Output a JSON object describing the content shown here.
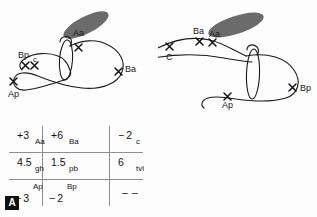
{
  "figure": {
    "panels": [
      {
        "id": "A",
        "badge": "A",
        "diagram": {
          "markers": [
            {
              "label": "Aa",
              "x": 78,
              "y": 38
            },
            {
              "label": "Ba",
              "x": 119,
              "y": 70
            },
            {
              "label": "Bp",
              "x": 22,
              "y": 58
            },
            {
              "label": "c",
              "x": 35,
              "y": 59
            },
            {
              "label": "Ap",
              "x": 12,
              "y": 88
            }
          ],
          "shapes": {
            "ellipse_fill": "#6b6b6b",
            "curve_stroke": "#1a1a1a"
          }
        },
        "table": {
          "rows": [
            [
              {
                "num": "+3",
                "tag": "Aa",
                "layout": "numtag"
              },
              {
                "num": "+6",
                "tag": "Ba",
                "layout": "numtag"
              },
              {
                "num": "− 2",
                "tag": "c",
                "layout": "numtag"
              }
            ],
            [
              {
                "num": "4.5",
                "tag": "gh",
                "layout": "numtag"
              },
              {
                "num": "1.5",
                "tag": "pb",
                "layout": "numtag"
              },
              {
                "num": "6",
                "tag": "tvl",
                "layout": "numtag"
              }
            ],
            [
              {
                "num": "− 3",
                "tag": "Ap",
                "layout": "tagnum"
              },
              {
                "num": "− 2",
                "tag": "Bp",
                "layout": "tagnum"
              },
              {
                "num": "– –",
                "tag": "",
                "layout": "dash"
              }
            ]
          ]
        }
      },
      {
        "id": "B",
        "badge": "B",
        "diagram": {
          "markers": [
            {
              "label": "Ba",
              "x": 40,
              "y": 33
            },
            {
              "label": "Aa",
              "x": 56,
              "y": 36
            },
            {
              "label": "C",
              "x": 12,
              "y": 46
            },
            {
              "label": "Ap",
              "x": 70,
              "y": 99
            },
            {
              "label": "Bp",
              "x": 136,
              "y": 90
            }
          ],
          "shapes": {
            "ellipse_fill": "#6b6b6b",
            "curve_stroke": "#1a1a1a"
          }
        },
        "table": {
          "rows": [
            [
              {
                "num": "− 3",
                "tag": "Aa",
                "layout": "numtag"
              },
              {
                "num": "− 3",
                "tag": "Ba",
                "layout": "numtag"
              },
              {
                "num": "− 6",
                "tag": "c",
                "layout": "numtag"
              }
            ],
            [
              {
                "num": "4.5",
                "tag": "gh",
                "layout": "numtag"
              },
              {
                "num": "1",
                "tag": "pb",
                "layout": "numtag"
              },
              {
                "num": "8",
                "tag": "tvl",
                "layout": "numtag"
              }
            ],
            [
              {
                "num": "+2",
                "tag": "Ap",
                "layout": "tagnum"
              },
              {
                "num": "+5",
                "tag": "Bp",
                "layout": "tagnum"
              },
              {
                "num": "—",
                "tag": "",
                "layout": "dash"
              }
            ]
          ]
        }
      }
    ]
  }
}
